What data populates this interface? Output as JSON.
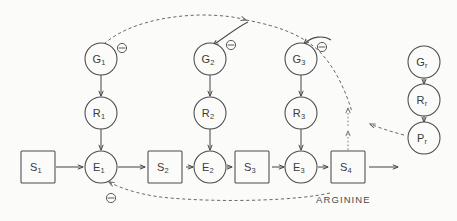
{
  "diagram": {
    "caption": "ARGININE",
    "colors": {
      "stroke": "#4a4a4a",
      "dashed_stroke": "#6a6a6a",
      "dotted_stroke": "#7a7a7a",
      "background": "#fbfbfa",
      "text": "#3a3a3a"
    },
    "inhibition_symbol": "⊖",
    "substrates": [
      {
        "id": "S1",
        "base": "S",
        "sub": "1",
        "x": 38,
        "y": 167
      },
      {
        "id": "S2",
        "base": "S",
        "sub": "2",
        "x": 165,
        "y": 167
      },
      {
        "id": "S3",
        "base": "S",
        "sub": "3",
        "x": 252,
        "y": 167
      },
      {
        "id": "S4",
        "base": "S",
        "sub": "4",
        "x": 348,
        "y": 167
      }
    ],
    "enzymes": [
      {
        "id": "E1",
        "base": "E",
        "sub": "1",
        "x": 101,
        "y": 167
      },
      {
        "id": "E2",
        "base": "E",
        "sub": "2",
        "x": 210,
        "y": 167
      },
      {
        "id": "E3",
        "base": "E",
        "sub": "3",
        "x": 301,
        "y": 167
      }
    ],
    "rna": [
      {
        "id": "R1",
        "base": "R",
        "sub": "1",
        "x": 101,
        "y": 113
      },
      {
        "id": "R2",
        "base": "R",
        "sub": "2",
        "x": 210,
        "y": 113
      },
      {
        "id": "R3",
        "base": "R",
        "sub": "3",
        "x": 301,
        "y": 113
      }
    ],
    "genes": [
      {
        "id": "G1",
        "base": "G",
        "sub": "1",
        "x": 101,
        "y": 59
      },
      {
        "id": "G2",
        "base": "G",
        "sub": "2",
        "x": 210,
        "y": 59
      },
      {
        "id": "G3",
        "base": "G",
        "sub": "3",
        "x": 301,
        "y": 59
      }
    ],
    "regulator_chain": [
      {
        "id": "Gr",
        "base": "G",
        "sub": "r",
        "x": 424,
        "y": 62
      },
      {
        "id": "Rr",
        "base": "R",
        "sub": "r",
        "x": 424,
        "y": 100
      },
      {
        "id": "Pr",
        "base": "P",
        "sub": "r",
        "x": 424,
        "y": 138
      }
    ],
    "inhibition_markers": [
      {
        "id": "minus-G1",
        "x": 122,
        "y": 48
      },
      {
        "id": "minus-G2",
        "x": 231,
        "y": 45
      },
      {
        "id": "minus-G3",
        "x": 322,
        "y": 47
      },
      {
        "id": "minus-E1",
        "x": 111,
        "y": 198
      }
    ]
  }
}
